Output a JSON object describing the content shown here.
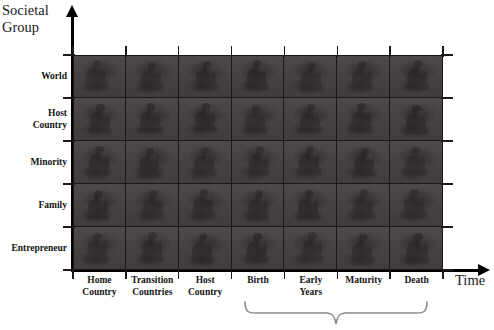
{
  "figure": {
    "type": "matrix-diagram",
    "y_axis": {
      "title": "Societal\nGroup",
      "categories": [
        "World",
        "Host\nCountry",
        "Minority",
        "Family",
        "Entrepreneur"
      ]
    },
    "x_axis": {
      "title": "Time",
      "categories": [
        "Home\nCountry",
        "Transition\nCountries",
        "Host\nCountry",
        "Birth",
        "Early\nYears",
        "Maturity",
        "Death"
      ]
    },
    "grouping_brace": {
      "label": "",
      "spans_from": "Birth",
      "spans_to": "Death"
    },
    "grid": {
      "columns": 7,
      "rows": 5,
      "cell_fill": "#474344",
      "cell_motif": "person-silhouette",
      "line_color": "#181617"
    },
    "colors": {
      "background": "#ffffff",
      "axis": "#000000",
      "text": "#141414",
      "plot_fill": "#474344"
    }
  }
}
